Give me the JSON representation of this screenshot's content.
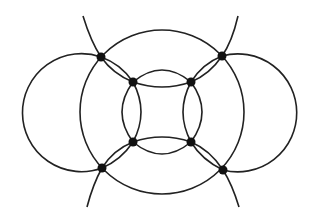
{
  "diagram": {
    "type": "graph",
    "stroke_color": "#222222",
    "node_color": "#111111",
    "background": "#ffffff",
    "nodes": [
      {
        "id": "outer-top-left",
        "ring": "outer"
      },
      {
        "id": "outer-top-right",
        "ring": "outer"
      },
      {
        "id": "outer-bottom-left",
        "ring": "outer"
      },
      {
        "id": "outer-bottom-right",
        "ring": "outer"
      },
      {
        "id": "inner-top-left",
        "ring": "inner"
      },
      {
        "id": "inner-top-right",
        "ring": "inner"
      },
      {
        "id": "inner-bottom-left",
        "ring": "inner"
      },
      {
        "id": "inner-bottom-right",
        "ring": "inner"
      }
    ],
    "edges": [
      {
        "from": "inner-top-left",
        "to": "inner-top-right",
        "multiplicity": 2
      },
      {
        "from": "inner-bottom-left",
        "to": "inner-bottom-right",
        "multiplicity": 2
      },
      {
        "from": "inner-top-left",
        "to": "inner-bottom-left",
        "multiplicity": 2
      },
      {
        "from": "inner-top-right",
        "to": "inner-bottom-right",
        "multiplicity": 2
      },
      {
        "from": "outer-top-left",
        "to": "inner-top-left",
        "multiplicity": 2
      },
      {
        "from": "outer-top-right",
        "to": "inner-top-right",
        "multiplicity": 2
      },
      {
        "from": "outer-bottom-left",
        "to": "inner-bottom-left",
        "multiplicity": 2
      },
      {
        "from": "outer-bottom-right",
        "to": "inner-bottom-right",
        "multiplicity": 2
      },
      {
        "from": "outer-top-left",
        "to": "outer-top-right",
        "multiplicity": 1
      },
      {
        "from": "outer-bottom-left",
        "to": "outer-bottom-right",
        "multiplicity": 1
      },
      {
        "from": "outer-top-left",
        "to": "outer-bottom-left",
        "multiplicity": 2
      },
      {
        "from": "outer-top-right",
        "to": "outer-bottom-right",
        "multiplicity": 2
      }
    ],
    "node_count": 8
  }
}
